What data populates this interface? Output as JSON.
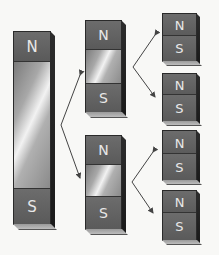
{
  "diagram": {
    "colors": {
      "background": "#f8f8f6",
      "pole": "#606060",
      "pole_label": "#e8e8e8",
      "body_highlight": "#f2f2f2",
      "arrow": "#444444"
    },
    "magnets": [
      {
        "id": "large",
        "north_label": "N",
        "south_label": "S"
      },
      {
        "id": "medium-top",
        "north_label": "N",
        "south_label": "S"
      },
      {
        "id": "medium-bottom",
        "north_label": "N",
        "south_label": "S"
      },
      {
        "id": "small-1",
        "north_label": "N",
        "south_label": "S"
      },
      {
        "id": "small-2",
        "north_label": "N",
        "south_label": "S"
      },
      {
        "id": "small-3",
        "north_label": "N",
        "south_label": "S"
      },
      {
        "id": "small-4",
        "north_label": "N",
        "south_label": "S"
      }
    ]
  }
}
